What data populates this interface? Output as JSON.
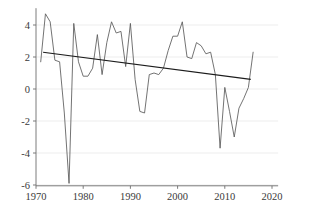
{
  "chart_data": {
    "type": "line",
    "title": "",
    "subtitle": "",
    "xlabel": "",
    "ylabel": "",
    "xlim": [
      1969,
      2021
    ],
    "ylim": [
      -6.4,
      5.2
    ],
    "grid": true,
    "legend": "none",
    "xticks": [
      1970,
      1980,
      1990,
      2000,
      2010,
      2020
    ],
    "xticklabels": [
      "1970",
      "1980",
      "1990",
      "2000",
      "2010",
      "2020"
    ],
    "yticks": [
      -6,
      -4,
      -2,
      0,
      2,
      4
    ],
    "yticklabels": [
      "-6",
      "-4",
      "-2",
      "0",
      "2",
      "4"
    ],
    "series": [
      {
        "name": "observed",
        "color": "#5a5a5a",
        "x": [
          1971,
          1972,
          1973,
          1974,
          1975,
          1976,
          1977,
          1978,
          1979,
          1980,
          1981,
          1982,
          1983,
          1984,
          1985,
          1986,
          1987,
          1988,
          1989,
          1990,
          1991,
          1992,
          1993,
          1994,
          1995,
          1996,
          1997,
          1998,
          1999,
          2000,
          2001,
          2002,
          2003,
          2004,
          2005,
          2006,
          2007,
          2008,
          2009,
          2010,
          2011,
          2012,
          2013,
          2014,
          2015,
          2016
        ],
        "values": [
          1.7,
          4.7,
          4.2,
          1.8,
          1.7,
          -1.5,
          -5.9,
          4.1,
          1.7,
          0.8,
          0.8,
          1.3,
          3.4,
          0.9,
          2.9,
          4.2,
          3.5,
          3.6,
          1.4,
          4.1,
          0.6,
          -1.4,
          -1.5,
          0.9,
          1.0,
          0.9,
          1.3,
          2.4,
          3.3,
          3.3,
          4.2,
          2.0,
          1.9,
          2.9,
          2.7,
          2.2,
          2.3,
          0.9,
          -3.7,
          0.1,
          -1.4,
          -3.0,
          -1.2,
          -0.6,
          0.1,
          2.3
        ]
      },
      {
        "name": "linear trend",
        "color": "#1c1c1c",
        "x": [
          1971.5,
          2015.5
        ],
        "values": [
          2.3,
          0.6
        ]
      }
    ]
  }
}
